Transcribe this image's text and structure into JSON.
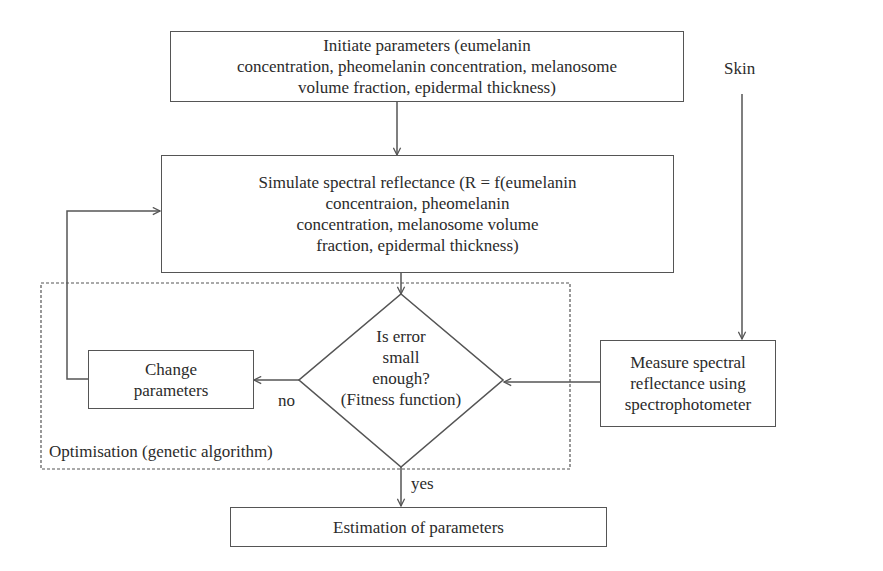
{
  "diagram": {
    "nodes": {
      "initiate": {
        "text": "Initiate parameters (eumelanin\nconcentration, pheomelanin concentration, melanosome\nvolume fraction, epidermal thickness)"
      },
      "simulate": {
        "text": "Simulate spectral reflectance (R = f(eumelanin\nconcentraion, pheomelanin\nconcentration, melanosome volume\nfraction, epidermal thickness)"
      },
      "decision": {
        "text": "Is error\nsmall\nenough?\n(Fitness function)"
      },
      "change": {
        "text": "Change\nparameters"
      },
      "measure": {
        "text": "Measure spectral\nreflectance using\nspectrophotometer"
      },
      "estimation": {
        "text": "Estimation of parameters"
      }
    },
    "labels": {
      "skin": "Skin",
      "no": "no",
      "yes": "yes",
      "optimisation": "Optimisation (genetic algorithm)"
    },
    "colors": {
      "line": "#555555",
      "text": "#2b2b2b",
      "background": "#ffffff"
    }
  }
}
